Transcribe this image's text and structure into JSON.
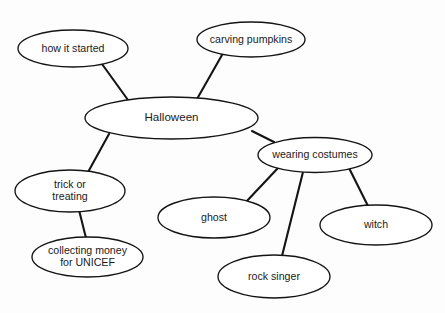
{
  "diagram": {
    "type": "mind-map",
    "title": "Halloween",
    "canvas": {
      "width": 445,
      "height": 313
    },
    "style": {
      "background_color": "#fdfdfd",
      "node_fill": "#ffffff",
      "node_stroke": "#141414",
      "edge_stroke": "#141414",
      "text_color": "#1a1a1a"
    },
    "nodes": [
      {
        "id": "halloween",
        "label": "Halloween",
        "lines": [
          "Halloween"
        ],
        "role": "root",
        "cx": 171.5,
        "cy": 118.0,
        "rx": 86.5,
        "ry": 21.0,
        "font": "center"
      },
      {
        "id": "how-it-started",
        "label": "how it started",
        "lines": [
          "how it started"
        ],
        "role": "branch",
        "cx": 73.0,
        "cy": 48.5,
        "rx": 55.0,
        "ry": 18.5,
        "font": "normal"
      },
      {
        "id": "carving-pumpkins",
        "label": "carving pumpkins",
        "lines": [
          "carving pumpkins"
        ],
        "role": "branch",
        "cx": 251.0,
        "cy": 39.5,
        "rx": 54.0,
        "ry": 17.5,
        "font": "normal"
      },
      {
        "id": "trick-or-treating",
        "label": "trick or treating",
        "lines": [
          "trick or",
          "treating"
        ],
        "role": "branch",
        "cx": 70.0,
        "cy": 191.0,
        "rx": 55.0,
        "ry": 21.0,
        "font": "normal"
      },
      {
        "id": "collecting-money",
        "label": "collecting money for UNICEF",
        "lines": [
          "collecting money",
          "for UNICEF"
        ],
        "role": "leaf",
        "cx": 87.5,
        "cy": 257.0,
        "rx": 55.5,
        "ry": 20.0,
        "font": "normal"
      },
      {
        "id": "wearing-costumes",
        "label": "wearing costumes",
        "lines": [
          "wearing costumes"
        ],
        "role": "branch",
        "cx": 315.0,
        "cy": 155.0,
        "rx": 57.0,
        "ry": 17.5,
        "font": "normal"
      },
      {
        "id": "ghost",
        "label": "ghost",
        "lines": [
          "ghost"
        ],
        "role": "leaf",
        "cx": 214.0,
        "cy": 217.5,
        "rx": 56.0,
        "ry": 20.5,
        "font": "normal"
      },
      {
        "id": "rock-singer",
        "label": "rock singer",
        "lines": [
          "rock singer"
        ],
        "role": "leaf",
        "cx": 274.0,
        "cy": 276.5,
        "rx": 56.0,
        "ry": 21.5,
        "font": "normal"
      },
      {
        "id": "witch",
        "label": "witch",
        "lines": [
          "witch"
        ],
        "role": "leaf",
        "cx": 376.0,
        "cy": 225.0,
        "rx": 56.0,
        "ry": 20.0,
        "font": "normal"
      }
    ],
    "edges": [
      {
        "id": "edge-halloween-how-it-started",
        "from": "how-it-started",
        "to": "halloween",
        "x1": 102,
        "y1": 64,
        "x2": 128,
        "y2": 100
      },
      {
        "id": "edge-halloween-carving-pumpkins",
        "from": "carving-pumpkins",
        "to": "halloween",
        "x1": 222,
        "y1": 55,
        "x2": 197,
        "y2": 99
      },
      {
        "id": "edge-halloween-trick-or-treating",
        "from": "halloween",
        "to": "trick-or-treating",
        "x1": 109,
        "y1": 134,
        "x2": 87,
        "y2": 174
      },
      {
        "id": "edge-halloween-wearing-costumes",
        "from": "halloween",
        "to": "wearing-costumes",
        "x1": 252,
        "y1": 131,
        "x2": 274,
        "y2": 142
      },
      {
        "id": "edge-trick-or-treating-collecting-money",
        "from": "trick-or-treating",
        "to": "collecting-money",
        "x1": 79,
        "y1": 210,
        "x2": 86,
        "y2": 238
      },
      {
        "id": "edge-wearing-costumes-ghost",
        "from": "wearing-costumes",
        "to": "ghost",
        "x1": 278,
        "y1": 168,
        "x2": 245,
        "y2": 203
      },
      {
        "id": "edge-wearing-costumes-rock-singer",
        "from": "wearing-costumes",
        "to": "rock-singer",
        "x1": 303,
        "y1": 172,
        "x2": 282,
        "y2": 256
      },
      {
        "id": "edge-wearing-costumes-witch",
        "from": "wearing-costumes",
        "to": "witch",
        "x1": 349,
        "y1": 168,
        "x2": 368,
        "y2": 206
      }
    ]
  }
}
